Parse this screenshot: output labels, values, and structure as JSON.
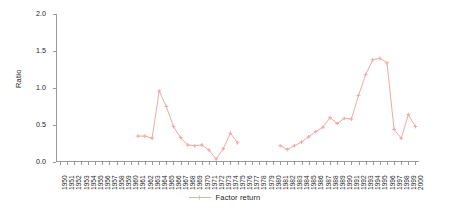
{
  "chart_data": {
    "type": "line",
    "title": "",
    "xlabel": "",
    "ylabel": "Ratio",
    "ylim": [
      0.0,
      2.0
    ],
    "xlim": [
      1950,
      2000
    ],
    "grid": false,
    "legend_position": "bottom-center",
    "yticks": [
      "0.0",
      "0.5",
      "1.0",
      "1.5",
      "2.0"
    ],
    "ytick_values": [
      0.0,
      0.5,
      1.0,
      1.5,
      2.0
    ],
    "categories": [
      "1950",
      "1951",
      "1952",
      "1953",
      "1954",
      "1955",
      "1956",
      "1957",
      "1958",
      "1959",
      "1960",
      "1961",
      "1962",
      "1963",
      "1964",
      "1965",
      "1966",
      "1967",
      "1968",
      "1969",
      "1970",
      "1971",
      "1972",
      "1973",
      "1974",
      "1975",
      "1976",
      "1977",
      "1978",
      "1979",
      "1980",
      "1981",
      "1982",
      "1983",
      "1984",
      "1985",
      "1986",
      "1987",
      "1988",
      "1989",
      "1990",
      "1991",
      "1992",
      "1993",
      "1994",
      "1995",
      "1996",
      "1997",
      "1998",
      "1999",
      "2000"
    ],
    "series": [
      {
        "name": "Factor return",
        "color": "#f0a8a4",
        "marker": "cross",
        "values": [
          null,
          null,
          null,
          null,
          null,
          null,
          null,
          null,
          null,
          null,
          null,
          0.35,
          0.35,
          0.32,
          0.96,
          0.75,
          0.48,
          0.33,
          0.23,
          0.22,
          0.23,
          0.16,
          0.04,
          0.18,
          0.39,
          0.26,
          null,
          null,
          null,
          null,
          null,
          0.22,
          0.17,
          0.22,
          0.27,
          0.34,
          0.41,
          0.47,
          0.6,
          0.52,
          0.59,
          0.58,
          0.9,
          1.18,
          1.38,
          1.4,
          1.34,
          0.44,
          0.32,
          0.64,
          0.48
        ]
      }
    ]
  },
  "legend": {
    "entries": [
      {
        "label": "Factor return"
      }
    ]
  }
}
